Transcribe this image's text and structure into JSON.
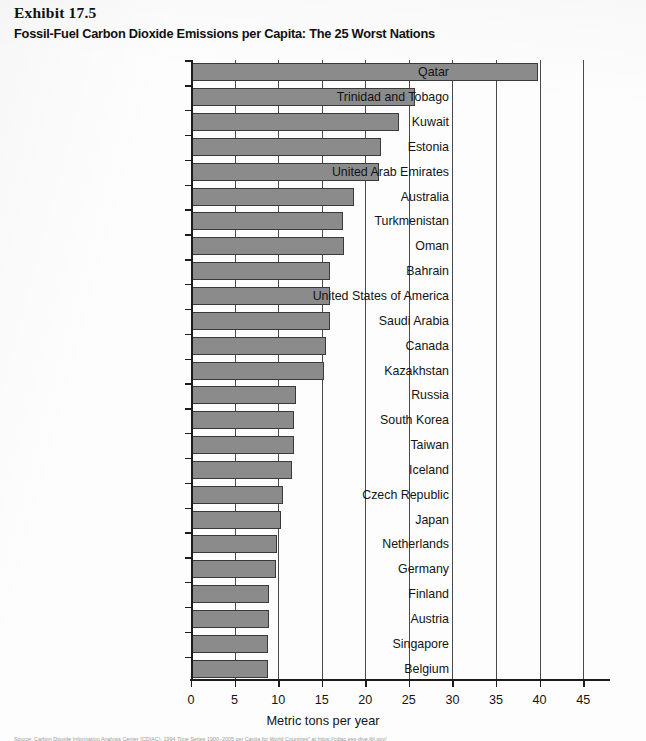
{
  "exhibit": {
    "label": "Exhibit 17.5",
    "title": "Fossil-Fuel Carbon Dioxide Emissions per Capita: The 25 Worst Nations"
  },
  "colors": {
    "bar_fill": "#8b8b8b",
    "bar_stroke": "#3a3a3a",
    "axis": "#1c1c1c",
    "gridline": "#4a4a4a",
    "text": "#141414",
    "page": "#fdfdfd"
  },
  "chart_data": {
    "type": "bar",
    "orientation": "horizontal",
    "title": "Fossil-Fuel Carbon Dioxide Emissions per Capita: The 25 Worst Nations",
    "xlabel": "Metric tons per year",
    "ylabel": "",
    "xlim": [
      0,
      47.5
    ],
    "xticks": [
      0,
      5,
      10,
      15,
      20,
      25,
      30,
      35,
      40,
      45
    ],
    "xticklabels": [
      "0",
      "5",
      "10",
      "15",
      "20",
      "25",
      "30",
      "35",
      "40",
      "45"
    ],
    "grid": true,
    "grid_axis": "x",
    "legend": false,
    "categories": [
      "Qatar",
      "Trinidad and Tobago",
      "Kuwait",
      "Estonia",
      "United Arab Emirates",
      "Australia",
      "Turkmenistan",
      "Oman",
      "Bahrain",
      "United States of America",
      "Saudi Arabia",
      "Canada",
      "Kazakhstan",
      "Russia",
      "South Korea",
      "Taiwan",
      "Iceland",
      "Czech Republic",
      "Japan",
      "Netherlands",
      "Germany",
      "Finland",
      "Austria",
      "Singapore",
      "Belgium"
    ],
    "values": [
      39.8,
      25.7,
      23.9,
      21.8,
      21.6,
      18.7,
      17.4,
      17.5,
      16.0,
      15.9,
      15.9,
      15.5,
      15.3,
      12.0,
      11.8,
      11.8,
      11.6,
      10.6,
      10.3,
      9.9,
      9.7,
      9.0,
      8.9,
      8.8,
      8.8
    ]
  },
  "source": {
    "note": "Source: Carbon Dioxide Information Analysis Center (CDIAC), 1994 Time Series 1900–2005 per Capita for World Countries\" at https://cdiac.ess-dive.lbl.gov/"
  }
}
